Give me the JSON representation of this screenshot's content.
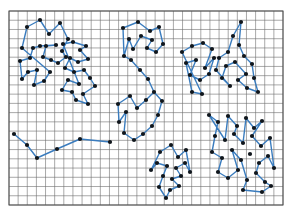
{
  "figure": {
    "title": "",
    "caption": "",
    "kind": "clustered-point-set-tour-diagram",
    "background_color": "#ffffff"
  },
  "grid": {
    "x": 9,
    "y": 11,
    "width": 274,
    "height": 194,
    "cell_size": 9.13,
    "cols": 30,
    "rows": 21,
    "line_color": "#6e6e6e",
    "line_width": 0.6,
    "border_color": "#4d4d4d",
    "border_width": 1.0,
    "fill_color": "#ffffff"
  },
  "style": {
    "edge_color": "#3a7cbe",
    "edge_width": 1.4,
    "node_color": "#10161c",
    "node_radius": 2.1,
    "accent_color": "#3a7cbe"
  },
  "chart_data": {
    "type": "scatter",
    "title": "",
    "xlabel": "",
    "ylabel": "",
    "xlim": [
      0,
      293
    ],
    "ylim": [
      0,
      220
    ],
    "grid": true,
    "legend": "none",
    "clusters": [
      {
        "name": "cluster-top-left",
        "nodes": [
          [
            27,
            27
          ],
          [
            40,
            20
          ],
          [
            49,
            34
          ],
          [
            60,
            23
          ],
          [
            68,
            39
          ],
          [
            22,
            48
          ],
          [
            33,
            48
          ],
          [
            40,
            46
          ],
          [
            46,
            46
          ],
          [
            56,
            45
          ],
          [
            62,
            51
          ],
          [
            20,
            61
          ],
          [
            30,
            58
          ],
          [
            43,
            57
          ],
          [
            51,
            60
          ],
          [
            58,
            63
          ],
          [
            66,
            57
          ],
          [
            28,
            72
          ],
          [
            37,
            70
          ],
          [
            50,
            72
          ],
          [
            22,
            79
          ],
          [
            44,
            81
          ],
          [
            34,
            85
          ]
        ],
        "path": [
          [
            22,
            48
          ],
          [
            27,
            27
          ],
          [
            40,
            20
          ],
          [
            49,
            34
          ],
          [
            60,
            23
          ],
          [
            68,
            39
          ],
          [
            62,
            51
          ],
          [
            66,
            57
          ],
          [
            58,
            63
          ],
          [
            51,
            60
          ],
          [
            43,
            57
          ],
          [
            46,
            46
          ],
          [
            56,
            45
          ],
          [
            40,
            46
          ],
          [
            33,
            48
          ],
          [
            30,
            58
          ],
          [
            20,
            61
          ],
          [
            22,
            79
          ],
          [
            28,
            72
          ],
          [
            37,
            70
          ],
          [
            34,
            85
          ],
          [
            44,
            81
          ],
          [
            50,
            72
          ],
          [
            22,
            48
          ]
        ]
      },
      {
        "name": "cluster-left-mid",
        "nodes": [
          [
            63,
            44
          ],
          [
            73,
            42
          ],
          [
            80,
            50
          ],
          [
            86,
            46
          ],
          [
            70,
            58
          ],
          [
            78,
            62
          ],
          [
            88,
            59
          ],
          [
            65,
            68
          ],
          [
            74,
            72
          ],
          [
            84,
            70
          ],
          [
            68,
            80
          ],
          [
            79,
            84
          ],
          [
            90,
            78
          ],
          [
            62,
            90
          ],
          [
            72,
            92
          ],
          [
            83,
            94
          ],
          [
            95,
            86
          ],
          [
            76,
            100
          ],
          [
            88,
            104
          ]
        ],
        "path": [
          [
            63,
            44
          ],
          [
            73,
            42
          ],
          [
            86,
            46
          ],
          [
            80,
            50
          ],
          [
            88,
            59
          ],
          [
            78,
            62
          ],
          [
            70,
            58
          ],
          [
            65,
            68
          ],
          [
            74,
            72
          ],
          [
            84,
            70
          ],
          [
            90,
            78
          ],
          [
            95,
            86
          ],
          [
            83,
            94
          ],
          [
            88,
            104
          ],
          [
            76,
            100
          ],
          [
            72,
            92
          ],
          [
            62,
            90
          ],
          [
            68,
            80
          ],
          [
            79,
            84
          ],
          [
            63,
            44
          ]
        ]
      },
      {
        "name": "cluster-center-top",
        "nodes": [
          [
            123,
            28
          ],
          [
            138,
            22
          ],
          [
            150,
            31
          ],
          [
            159,
            27
          ],
          [
            129,
            39
          ],
          [
            141,
            36
          ],
          [
            152,
            40
          ],
          [
            163,
            44
          ],
          [
            133,
            49
          ],
          [
            147,
            48
          ],
          [
            156,
            52
          ],
          [
            124,
            56
          ]
        ],
        "path": [
          [
            124,
            56
          ],
          [
            123,
            28
          ],
          [
            138,
            22
          ],
          [
            150,
            31
          ],
          [
            159,
            27
          ],
          [
            163,
            44
          ],
          [
            156,
            52
          ],
          [
            147,
            48
          ],
          [
            152,
            40
          ],
          [
            141,
            36
          ],
          [
            133,
            49
          ],
          [
            129,
            39
          ],
          [
            124,
            56
          ]
        ]
      },
      {
        "name": "cluster-center-mid",
        "nodes": [
          [
            131,
            60
          ],
          [
            140,
            70
          ],
          [
            148,
            79
          ],
          [
            130,
            96
          ],
          [
            118,
            104
          ],
          [
            126,
            112
          ],
          [
            137,
            108
          ],
          [
            146,
            100
          ],
          [
            154,
            92
          ],
          [
            162,
            101
          ],
          [
            158,
            115
          ],
          [
            152,
            126
          ],
          [
            143,
            134
          ],
          [
            134,
            140
          ],
          [
            124,
            133
          ],
          [
            119,
            122
          ]
        ],
        "path": [
          [
            124,
            56
          ],
          [
            131,
            60
          ],
          [
            140,
            70
          ],
          [
            148,
            79
          ],
          [
            154,
            92
          ],
          [
            146,
            100
          ],
          [
            137,
            108
          ],
          [
            130,
            96
          ],
          [
            118,
            104
          ],
          [
            119,
            122
          ],
          [
            126,
            112
          ],
          [
            124,
            133
          ],
          [
            134,
            140
          ],
          [
            143,
            134
          ],
          [
            152,
            126
          ],
          [
            158,
            115
          ],
          [
            162,
            101
          ],
          [
            154,
            92
          ]
        ]
      },
      {
        "name": "cluster-bottom-left-chain",
        "nodes": [
          [
            14,
            134
          ],
          [
            27,
            145
          ],
          [
            37,
            158
          ],
          [
            57,
            149
          ],
          [
            80,
            139
          ],
          [
            110,
            142
          ]
        ],
        "path": [
          [
            14,
            134
          ],
          [
            27,
            145
          ],
          [
            37,
            158
          ],
          [
            57,
            149
          ],
          [
            80,
            139
          ],
          [
            110,
            142
          ]
        ]
      },
      {
        "name": "cluster-bottom-center",
        "nodes": [
          [
            160,
            152
          ],
          [
            171,
            145
          ],
          [
            178,
            157
          ],
          [
            186,
            150
          ],
          [
            157,
            163
          ],
          [
            167,
            166
          ],
          [
            176,
            168
          ],
          [
            185,
            163
          ],
          [
            163,
            176
          ],
          [
            172,
            179
          ],
          [
            181,
            176
          ],
          [
            190,
            172
          ],
          [
            159,
            187
          ],
          [
            170,
            190
          ],
          [
            179,
            186
          ],
          [
            166,
            198
          ],
          [
            151,
            170
          ]
        ],
        "path": [
          [
            151,
            170
          ],
          [
            160,
            152
          ],
          [
            171,
            145
          ],
          [
            178,
            157
          ],
          [
            186,
            150
          ],
          [
            190,
            172
          ],
          [
            185,
            163
          ],
          [
            176,
            168
          ],
          [
            181,
            176
          ],
          [
            172,
            179
          ],
          [
            179,
            186
          ],
          [
            170,
            190
          ],
          [
            166,
            198
          ],
          [
            159,
            187
          ],
          [
            163,
            176
          ],
          [
            167,
            166
          ],
          [
            157,
            163
          ],
          [
            151,
            170
          ]
        ]
      },
      {
        "name": "cluster-right-top",
        "nodes": [
          [
            182,
            52
          ],
          [
            192,
            46
          ],
          [
            203,
            43
          ],
          [
            212,
            49
          ],
          [
            186,
            63
          ],
          [
            196,
            60
          ],
          [
            205,
            68
          ],
          [
            214,
            58
          ],
          [
            190,
            75
          ],
          [
            200,
            80
          ],
          [
            209,
            74
          ],
          [
            192,
            92
          ],
          [
            202,
            94
          ]
        ],
        "path": [
          [
            182,
            52
          ],
          [
            192,
            46
          ],
          [
            203,
            43
          ],
          [
            212,
            49
          ],
          [
            205,
            68
          ],
          [
            214,
            58
          ],
          [
            209,
            74
          ],
          [
            200,
            80
          ],
          [
            190,
            75
          ],
          [
            196,
            60
          ],
          [
            186,
            63
          ],
          [
            192,
            92
          ],
          [
            202,
            94
          ],
          [
            182,
            52
          ]
        ]
      },
      {
        "name": "cluster-right-upper",
        "nodes": [
          [
            241,
            22
          ],
          [
            233,
            36
          ],
          [
            239,
            45
          ],
          [
            228,
            52
          ],
          [
            219,
            58
          ],
          [
            226,
            66
          ],
          [
            235,
            62
          ],
          [
            244,
            56
          ],
          [
            252,
            64
          ],
          [
            246,
            74
          ],
          [
            238,
            80
          ],
          [
            230,
            86
          ],
          [
            222,
            78
          ],
          [
            216,
            70
          ],
          [
            247,
            88
          ],
          [
            254,
            78
          ],
          [
            258,
            92
          ]
        ],
        "path": [
          [
            216,
            70
          ],
          [
            219,
            58
          ],
          [
            228,
            52
          ],
          [
            233,
            36
          ],
          [
            241,
            22
          ],
          [
            239,
            45
          ],
          [
            244,
            56
          ],
          [
            252,
            64
          ],
          [
            254,
            78
          ],
          [
            258,
            92
          ],
          [
            247,
            88
          ],
          [
            238,
            80
          ],
          [
            246,
            74
          ],
          [
            235,
            62
          ],
          [
            226,
            66
          ],
          [
            222,
            78
          ],
          [
            230,
            86
          ],
          [
            216,
            70
          ]
        ]
      },
      {
        "name": "cluster-right-lower",
        "nodes": [
          [
            209,
            115
          ],
          [
            218,
            122
          ],
          [
            228,
            116
          ],
          [
            237,
            126
          ],
          [
            246,
            118
          ],
          [
            254,
            128
          ],
          [
            262,
            121
          ],
          [
            215,
            136
          ],
          [
            225,
            140
          ],
          [
            234,
            134
          ],
          [
            243,
            143
          ],
          [
            252,
            136
          ],
          [
            261,
            146
          ],
          [
            270,
            138
          ],
          [
            212,
            152
          ],
          [
            222,
            158
          ],
          [
            232,
            150
          ],
          [
            241,
            160
          ],
          [
            250,
            154
          ],
          [
            259,
            163
          ],
          [
            268,
            156
          ],
          [
            218,
            172
          ],
          [
            228,
            178
          ],
          [
            238,
            170
          ],
          [
            247,
            180
          ],
          [
            256,
            173
          ],
          [
            265,
            182
          ],
          [
            274,
            168
          ],
          [
            243,
            190
          ],
          [
            262,
            192
          ],
          [
            271,
            186
          ]
        ],
        "path": [
          [
            209,
            115
          ],
          [
            218,
            122
          ],
          [
            215,
            136
          ],
          [
            212,
            152
          ],
          [
            222,
            158
          ],
          [
            218,
            172
          ],
          [
            228,
            178
          ],
          [
            238,
            170
          ],
          [
            232,
            150
          ],
          [
            241,
            160
          ],
          [
            247,
            180
          ],
          [
            243,
            190
          ],
          [
            262,
            192
          ],
          [
            271,
            186
          ],
          [
            265,
            182
          ],
          [
            256,
            173
          ],
          [
            259,
            163
          ],
          [
            268,
            156
          ],
          [
            274,
            168
          ],
          [
            270,
            138
          ],
          [
            261,
            146
          ],
          [
            252,
            136
          ],
          [
            262,
            121
          ],
          [
            254,
            128
          ],
          [
            246,
            118
          ],
          [
            243,
            143
          ],
          [
            234,
            134
          ],
          [
            237,
            126
          ],
          [
            228,
            116
          ],
          [
            225,
            140
          ],
          [
            209,
            115
          ]
        ]
      }
    ]
  }
}
